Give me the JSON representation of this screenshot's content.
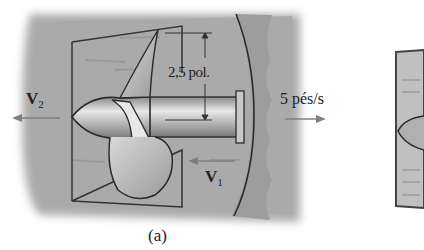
{
  "figure": {
    "panel_a": {
      "caption": "(a)",
      "dimension_label": "2,5 pol.",
      "velocity_in": {
        "symbol": "V",
        "subscript": "1"
      },
      "velocity_out": {
        "symbol": "V",
        "subscript": "2"
      },
      "boat_speed_label": "5 pés/s"
    },
    "colors": {
      "water": "#a9a9a9",
      "water_dark": "#8e8e8e",
      "hull": "#9a9a9a",
      "outline": "#2b2b2b",
      "arrow": "#808080",
      "background": "#ffffff"
    }
  }
}
